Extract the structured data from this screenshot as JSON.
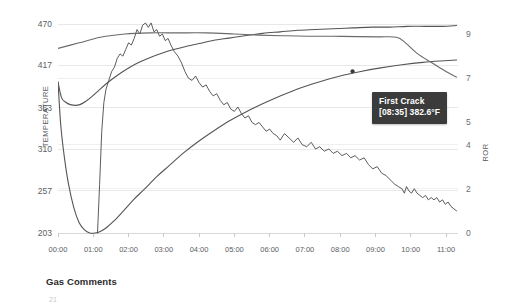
{
  "chart_data": {
    "type": "line",
    "title": "",
    "xlabel": "",
    "ylabel": "TEMPERATURE",
    "y2label": "ROR",
    "grid": true,
    "legend": "none",
    "xtick_labels": [
      "00:00",
      "01:00",
      "02:00",
      "03:00",
      "04:00",
      "05:00",
      "06:00",
      "07:00",
      "08:00",
      "09:00",
      "10:00",
      "11:00"
    ],
    "ytick_labels": [
      "470",
      "417",
      "363",
      "310",
      "257",
      "203"
    ],
    "ytick_values": [
      470,
      417,
      363,
      310,
      257,
      203
    ],
    "ylim": [
      203,
      470
    ],
    "y2tick_labels": [
      "9",
      "7",
      "5",
      "4",
      "2",
      "0"
    ],
    "y2tick_values": [
      9,
      7,
      5,
      4,
      2,
      0
    ],
    "y2lim": [
      0,
      9.6
    ],
    "xlim": [
      "00:00",
      "11:20"
    ],
    "series": [
      {
        "name": "Bean Temperature",
        "axis": "left",
        "color": "#555555",
        "points": [
          [
            0.0,
            396
          ],
          [
            0.1,
            376
          ],
          [
            0.22,
            370
          ],
          [
            0.35,
            367
          ],
          [
            0.5,
            366
          ],
          [
            0.62,
            367
          ],
          [
            0.78,
            371
          ],
          [
            0.95,
            377
          ],
          [
            1.15,
            385
          ],
          [
            1.35,
            393
          ],
          [
            1.55,
            400
          ],
          [
            1.8,
            408
          ],
          [
            2.05,
            415
          ],
          [
            2.3,
            421
          ],
          [
            2.6,
            427
          ],
          [
            2.9,
            432
          ],
          [
            3.25,
            437
          ],
          [
            3.6,
            441
          ],
          [
            4.0,
            445
          ],
          [
            4.4,
            449
          ],
          [
            4.85,
            452
          ],
          [
            5.3,
            455
          ],
          [
            5.8,
            458
          ],
          [
            6.3,
            460
          ],
          [
            6.8,
            462
          ],
          [
            7.3,
            463
          ],
          [
            7.8,
            464
          ],
          [
            8.35,
            465
          ],
          [
            8.9,
            466
          ],
          [
            9.4,
            466
          ],
          [
            9.9,
            467
          ],
          [
            10.4,
            467
          ],
          [
            10.9,
            467
          ],
          [
            11.3,
            468
          ]
        ]
      },
      {
        "name": "Environment Temperature",
        "axis": "left",
        "color": "#555555",
        "points": [
          [
            0.0,
            396
          ],
          [
            0.08,
            340
          ],
          [
            0.18,
            300
          ],
          [
            0.3,
            265
          ],
          [
            0.45,
            235
          ],
          [
            0.6,
            216
          ],
          [
            0.75,
            207
          ],
          [
            0.9,
            203
          ],
          [
            1.05,
            203
          ],
          [
            1.2,
            205
          ],
          [
            1.38,
            210
          ],
          [
            1.6,
            219
          ],
          [
            1.85,
            231
          ],
          [
            2.15,
            246
          ],
          [
            2.45,
            259
          ],
          [
            2.8,
            275
          ],
          [
            3.15,
            289
          ],
          [
            3.55,
            305
          ],
          [
            3.95,
            319
          ],
          [
            4.4,
            333
          ],
          [
            4.85,
            346
          ],
          [
            5.3,
            357
          ],
          [
            5.8,
            368
          ],
          [
            6.3,
            378
          ],
          [
            6.85,
            388
          ],
          [
            7.4,
            396
          ],
          [
            7.95,
            403
          ],
          [
            8.55,
            409
          ],
          [
            9.15,
            414
          ],
          [
            9.75,
            418
          ],
          [
            10.35,
            421
          ],
          [
            10.95,
            423
          ],
          [
            11.3,
            424
          ]
        ]
      },
      {
        "name": "Rate of Rise (ROR)",
        "axis": "right",
        "color": "#4a4a4a",
        "points": [
          [
            1.12,
            0.0
          ],
          [
            1.18,
            2.2
          ],
          [
            1.24,
            4.6
          ],
          [
            1.3,
            5.9
          ],
          [
            1.36,
            6.5
          ],
          [
            1.44,
            6.9
          ],
          [
            1.52,
            7.3
          ],
          [
            1.6,
            7.5
          ],
          [
            1.68,
            7.9
          ],
          [
            1.76,
            8.1
          ],
          [
            1.84,
            8.0
          ],
          [
            1.92,
            8.3
          ],
          [
            2.0,
            8.6
          ],
          [
            2.08,
            8.5
          ],
          [
            2.16,
            8.8
          ],
          [
            2.24,
            9.2
          ],
          [
            2.32,
            9.0
          ],
          [
            2.4,
            9.4
          ],
          [
            2.48,
            9.5
          ],
          [
            2.56,
            9.3
          ],
          [
            2.64,
            9.5
          ],
          [
            2.72,
            9.1
          ],
          [
            2.8,
            9.2
          ],
          [
            2.88,
            8.9
          ],
          [
            2.96,
            9.0
          ],
          [
            3.04,
            8.7
          ],
          [
            3.12,
            8.8
          ],
          [
            3.2,
            8.5
          ],
          [
            3.3,
            8.2
          ],
          [
            3.4,
            8.0
          ],
          [
            3.5,
            7.7
          ],
          [
            3.6,
            7.3
          ],
          [
            3.7,
            7.0
          ],
          [
            3.8,
            6.9
          ],
          [
            3.9,
            7.1
          ],
          [
            4.0,
            6.8
          ],
          [
            4.1,
            6.6
          ],
          [
            4.2,
            6.7
          ],
          [
            4.3,
            6.4
          ],
          [
            4.4,
            6.2
          ],
          [
            4.5,
            6.3
          ],
          [
            4.6,
            6.0
          ],
          [
            4.7,
            5.8
          ],
          [
            4.8,
            5.9
          ],
          [
            4.9,
            5.6
          ],
          [
            5.0,
            5.5
          ],
          [
            5.1,
            5.7
          ],
          [
            5.2,
            5.4
          ],
          [
            5.3,
            5.2
          ],
          [
            5.4,
            5.3
          ],
          [
            5.5,
            5.0
          ],
          [
            5.6,
            4.9
          ],
          [
            5.7,
            5.0
          ],
          [
            5.8,
            4.8
          ],
          [
            5.9,
            4.6
          ],
          [
            6.0,
            4.7
          ],
          [
            6.1,
            4.5
          ],
          [
            6.2,
            4.4
          ],
          [
            6.3,
            4.2
          ],
          [
            6.42,
            4.5
          ],
          [
            6.55,
            4.3
          ],
          [
            6.68,
            4.1
          ],
          [
            6.8,
            4.3
          ],
          [
            6.92,
            4.0
          ],
          [
            7.05,
            3.9
          ],
          [
            7.18,
            4.1
          ],
          [
            7.3,
            3.8
          ],
          [
            7.42,
            3.9
          ],
          [
            7.55,
            3.7
          ],
          [
            7.68,
            3.8
          ],
          [
            7.8,
            3.6
          ],
          [
            7.92,
            3.7
          ],
          [
            8.05,
            3.5
          ],
          [
            8.18,
            3.6
          ],
          [
            8.3,
            3.4
          ],
          [
            8.42,
            3.5
          ],
          [
            8.55,
            3.3
          ],
          [
            8.68,
            3.4
          ],
          [
            8.8,
            3.1
          ],
          [
            8.92,
            2.9
          ],
          [
            9.05,
            3.0
          ],
          [
            9.18,
            2.7
          ],
          [
            9.3,
            2.6
          ],
          [
            9.42,
            2.4
          ],
          [
            9.55,
            2.2
          ],
          [
            9.65,
            2.1
          ],
          [
            9.75,
            2.0
          ],
          [
            9.82,
            1.8
          ],
          [
            9.88,
            2.1
          ],
          [
            9.95,
            1.9
          ],
          [
            10.02,
            1.8
          ],
          [
            10.1,
            2.0
          ],
          [
            10.18,
            1.8
          ],
          [
            10.26,
            1.7
          ],
          [
            10.34,
            1.6
          ],
          [
            10.42,
            1.7
          ],
          [
            10.5,
            1.5
          ],
          [
            10.58,
            1.6
          ],
          [
            10.66,
            1.5
          ],
          [
            10.74,
            1.6
          ],
          [
            10.82,
            1.4
          ],
          [
            10.9,
            1.5
          ],
          [
            10.98,
            1.3
          ],
          [
            11.06,
            1.4
          ],
          [
            11.14,
            1.2
          ],
          [
            11.22,
            1.1
          ],
          [
            11.3,
            1.0
          ]
        ]
      },
      {
        "name": "Gas Setting",
        "axis": "right",
        "color": "#6a6a6a",
        "points": [
          [
            0.0,
            8.35
          ],
          [
            0.6,
            8.6
          ],
          [
            1.2,
            8.85
          ],
          [
            1.9,
            9.0
          ],
          [
            2.6,
            9.05
          ],
          [
            3.4,
            9.05
          ],
          [
            4.2,
            9.05
          ],
          [
            5.0,
            9.0
          ],
          [
            5.7,
            8.95
          ],
          [
            6.4,
            8.92
          ],
          [
            7.1,
            8.9
          ],
          [
            7.8,
            8.9
          ],
          [
            8.5,
            8.88
          ],
          [
            9.1,
            8.87
          ],
          [
            9.6,
            8.85
          ],
          [
            9.85,
            8.6
          ],
          [
            10.2,
            8.1
          ],
          [
            10.6,
            7.7
          ],
          [
            11.0,
            7.3
          ],
          [
            11.3,
            7.05
          ]
        ]
      }
    ],
    "annotation": {
      "label": "First Crack",
      "detail": "[08:35] 382.6°F",
      "time": "08:35",
      "temperature": "382.6°F",
      "marker_x": 8.35,
      "marker_y": 382.6
    }
  },
  "axes": {
    "left_title": "TEMPERATURE",
    "right_title": "ROR"
  },
  "tooltip": {
    "title": "First Crack",
    "detail": "[08:35] 382.6°F"
  },
  "footer": {
    "gas_comments_heading": "Gas Comments",
    "partial_label": "21"
  },
  "colors": {
    "background": "#ffffff",
    "grid": "#e8e8e8",
    "axis_text": "#5a5e62",
    "curve": "#555555",
    "tooltip_bg": "#3b3b3b",
    "tooltip_text": "#ffffff"
  }
}
